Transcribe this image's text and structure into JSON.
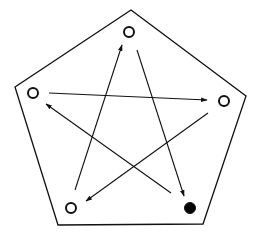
{
  "diagram": {
    "type": "directed-graph-in-pentagon",
    "colors": {
      "stroke": "#111111",
      "background": "#ffffff",
      "filled_node": "#000000"
    },
    "pentagon": [
      [
        131,
        10
      ],
      [
        246,
        96
      ],
      [
        203,
        224
      ],
      [
        58,
        225
      ],
      [
        15,
        87
      ]
    ],
    "nodes": [
      {
        "id": "top",
        "x": 129,
        "y": 32,
        "filled": false
      },
      {
        "id": "right",
        "x": 224,
        "y": 101,
        "filled": false
      },
      {
        "id": "bottom-right",
        "x": 190,
        "y": 208,
        "filled": true
      },
      {
        "id": "bottom-left",
        "x": 71,
        "y": 208,
        "filled": false
      },
      {
        "id": "left",
        "x": 33,
        "y": 93,
        "filled": false
      }
    ],
    "edges": [
      {
        "from": "top",
        "to": "bottom-right",
        "x1": 137,
        "y1": 50,
        "x2": 184,
        "y2": 196
      },
      {
        "from": "left",
        "to": "right",
        "x1": 49,
        "y1": 93,
        "x2": 207,
        "y2": 100
      },
      {
        "from": "right",
        "to": "bottom-left",
        "x1": 208,
        "y1": 113,
        "x2": 86,
        "y2": 201
      },
      {
        "from": "bottom-left",
        "to": "top",
        "x1": 75,
        "y1": 190,
        "x2": 122,
        "y2": 45
      },
      {
        "from": "bottom-right",
        "to": "left",
        "x1": 171,
        "y1": 193,
        "x2": 46,
        "y2": 104
      }
    ]
  }
}
